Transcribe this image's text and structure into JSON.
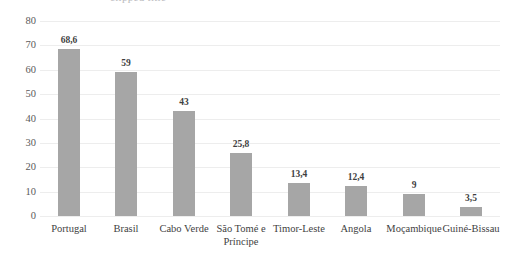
{
  "chart_data": {
    "type": "bar",
    "title": "",
    "xlabel": "",
    "ylabel": "",
    "ylim": [
      0,
      80
    ],
    "ytick_step": 10,
    "yticks": [
      "80",
      "70",
      "60",
      "50",
      "40",
      "30",
      "20",
      "10",
      "0"
    ],
    "grid": true,
    "legend": "none",
    "bar_color": "#a6a6a6",
    "gridline_color": "#ededed",
    "decimal_separator": ",",
    "categories": [
      "Portugal",
      "Brasil",
      "Cabo Verde",
      "São Tomé e Príncipe",
      "Timor-Leste",
      "Angola",
      "Moçambique",
      "Guiné-Bissau"
    ],
    "values": [
      68.6,
      59,
      43,
      25.8,
      13.4,
      12.4,
      9,
      3.5
    ],
    "data_labels": [
      "68,6",
      "59",
      "43",
      "25,8",
      "13,4",
      "12,4",
      "9",
      "3,5"
    ]
  },
  "axis": {
    "y_tick_labels": [
      "80",
      "70",
      "60",
      "50",
      "40",
      "30",
      "20",
      "10",
      "0"
    ],
    "x_tick_labels": [
      "Portugal",
      "Brasil",
      "Cabo Verde",
      "São Tomé e Príncipe",
      "Timor-Leste",
      "Angola",
      "Moçambique",
      "Guiné-Bissau"
    ]
  },
  "title_remnant": {
    "text": "clipped title"
  }
}
